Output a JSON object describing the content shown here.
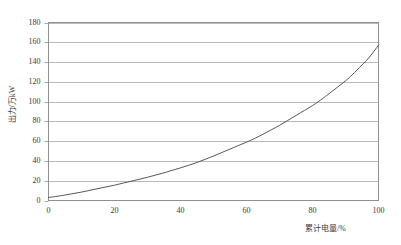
{
  "chart_data": {
    "type": "line",
    "title": "",
    "subtitle": "",
    "xlabel": "累计电量/%",
    "ylabel": "出力/万kW",
    "xlim": [
      0,
      100
    ],
    "ylim": [
      0,
      180
    ],
    "xticks": [
      "0",
      "20",
      "40",
      "60",
      "80",
      "100"
    ],
    "xtick_values": [
      0,
      20,
      40,
      60,
      80,
      100
    ],
    "yticks": [
      "0",
      "20",
      "40",
      "60",
      "80",
      "100",
      "120",
      "140",
      "160",
      "180"
    ],
    "ytick_values": [
      0,
      20,
      40,
      60,
      80,
      100,
      120,
      140,
      160,
      180
    ],
    "grid": "horizontal",
    "grid_color": "#a8a8a8",
    "legend": "none",
    "series": [
      {
        "name": "出力",
        "color": "#444444",
        "x": [
          0,
          5,
          10,
          15,
          20,
          25,
          30,
          35,
          40,
          45,
          50,
          55,
          60,
          62,
          65,
          70,
          75,
          80,
          83,
          85,
          90,
          92,
          95,
          97,
          100
        ],
        "values": [
          3,
          5.5,
          8.5,
          12,
          15.5,
          19.5,
          23.5,
          28,
          33,
          38.5,
          45,
          52,
          59,
          62,
          67,
          76,
          86,
          96,
          103,
          108,
          121,
          127,
          137,
          144,
          157
        ]
      }
    ],
    "annotations": []
  },
  "figure": {
    "background_color": "#ffffff",
    "border_color": "#909090",
    "axis_color": "#909090"
  }
}
